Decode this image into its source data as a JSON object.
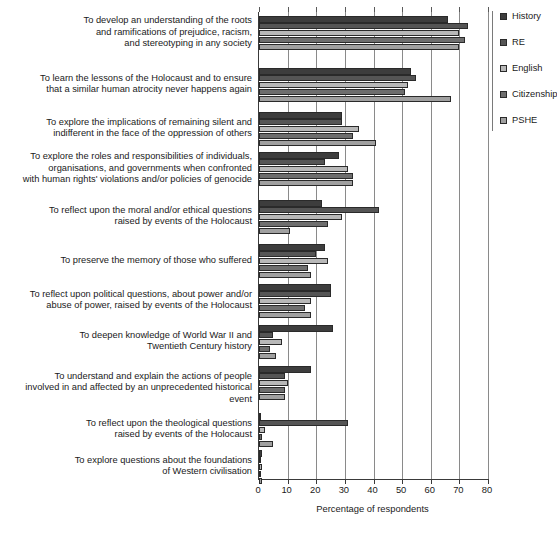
{
  "chart_data": {
    "type": "bar",
    "orientation": "horizontal",
    "title": "",
    "xlabel": "Percentage of respondents",
    "ylabel": "",
    "xlim": [
      0,
      80
    ],
    "xticks": [
      0,
      10,
      20,
      30,
      40,
      50,
      60,
      70,
      80
    ],
    "grid": true,
    "legend_position": "right",
    "categories": [
      "To develop an understanding of the roots\nand ramifications of prejudice, racism,\nand stereotyping in any society",
      "To learn the lessons of the Holocaust and to ensure\nthat a similar human atrocity never happens again",
      "To explore the implications of remaining silent and\nindifferent in the face of the oppression of others",
      "To explore the roles and responsibilities of individuals,\norganisations, and governments when confronted\nwith human rights' violations and/or policies of genocide",
      "To reflect upon the moral and/or ethical questions\nraised by events of the Holocaust",
      "To preserve the memory of those who suffered",
      "To reflect upon political questions, about power and/or\nabuse of power, raised by events of the Holocaust",
      "To deepen knowledge of World War II and\nTwentieth Century history",
      "To understand and explain the actions of people\ninvolved in and affected by an unprecedented historical event",
      "To reflect upon the theological questions\nraised by events of the Holocaust",
      "To explore questions about the foundations\nof Western civilisation"
    ],
    "series": [
      {
        "name": "History",
        "color": "#3d3d3d",
        "values": [
          66,
          53,
          29,
          28,
          22,
          23,
          25,
          26,
          18,
          0.8,
          1.2
        ]
      },
      {
        "name": "RE",
        "color": "#555555",
        "values": [
          73,
          55,
          29,
          23,
          42,
          20,
          25,
          5,
          9,
          31,
          0.8
        ]
      },
      {
        "name": "English",
        "color": "#b8b8b8",
        "values": [
          70,
          52,
          35,
          31,
          29,
          24,
          18,
          8,
          10,
          2,
          1.0
        ]
      },
      {
        "name": "Citizenship",
        "color": "#6e6e6e",
        "values": [
          72,
          51,
          33,
          33,
          24,
          17,
          16,
          4,
          9,
          1,
          0.6
        ]
      },
      {
        "name": "PSHE",
        "color": "#a0a0a0",
        "values": [
          70,
          67,
          41,
          33,
          11,
          18,
          18,
          6,
          9,
          5,
          0.9
        ]
      }
    ]
  },
  "legend": {
    "items": [
      {
        "label": "History"
      },
      {
        "label": "RE"
      },
      {
        "label": "English"
      },
      {
        "label": "Citizenship"
      },
      {
        "label": "PSHE"
      }
    ]
  }
}
